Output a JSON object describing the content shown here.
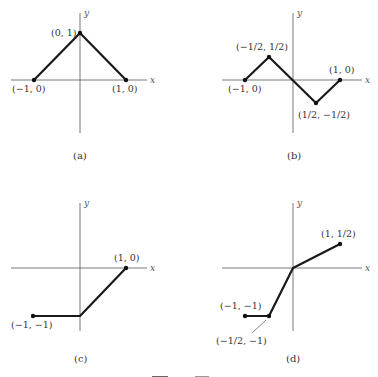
{
  "figure": {
    "caption_partial": "Figure",
    "panels": [
      {
        "id": "a",
        "caption": "(a)",
        "axis_x_label": "x",
        "axis_y_label": "y",
        "points": [
          {
            "label": "(−1, 0)",
            "x": -1,
            "y": 0
          },
          {
            "label": "(0, 1)",
            "x": 0,
            "y": 1
          },
          {
            "label": "(1, 0)",
            "x": 1,
            "y": 0
          }
        ]
      },
      {
        "id": "b",
        "caption": "(b)",
        "axis_x_label": "x",
        "axis_y_label": "y",
        "points": [
          {
            "label": "(−1, 0)",
            "x": -1,
            "y": 0
          },
          {
            "label": "(−1/2, 1/2)",
            "x": -0.5,
            "y": 0.5
          },
          {
            "label": "(1/2, −1/2)",
            "x": 0.5,
            "y": -0.5
          },
          {
            "label": "(1, 0)",
            "x": 1,
            "y": 0
          }
        ]
      },
      {
        "id": "c",
        "caption": "(c)",
        "axis_x_label": "x",
        "axis_y_label": "y",
        "points": [
          {
            "label": "(−1, −1)",
            "x": -1,
            "y": -1
          },
          {
            "label": "",
            "x": 0,
            "y": -1
          },
          {
            "label": "(1, 0)",
            "x": 1,
            "y": 0
          }
        ]
      },
      {
        "id": "d",
        "caption": "(d)",
        "axis_x_label": "x",
        "axis_y_label": "y",
        "points": [
          {
            "label": "(−1, −1)",
            "x": -1,
            "y": -1
          },
          {
            "label": "(−1/2, −1)",
            "x": -0.5,
            "y": -1
          },
          {
            "label": "",
            "x": 0,
            "y": 0
          },
          {
            "label": "(1, 1/2)",
            "x": 1,
            "y": 0.5
          }
        ]
      }
    ]
  }
}
